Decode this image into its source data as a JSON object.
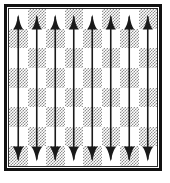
{
  "diagram": {
    "title": "Chessboard with file arrows",
    "type": "chess-board-annotation",
    "board": {
      "files": [
        "a",
        "b",
        "c",
        "d",
        "e",
        "f",
        "g",
        "h"
      ],
      "ranks": [
        "8",
        "7",
        "6",
        "5",
        "4",
        "3",
        "2",
        "1"
      ],
      "size": 8,
      "top_left_square_color": "light",
      "light_color": "#ffffff",
      "dark_color": "#8d8d8d",
      "dark_fill_style": "dither-checker",
      "border_color": "#111111",
      "squares": [
        [
          "light",
          "dark",
          "light",
          "dark",
          "light",
          "dark",
          "light",
          "dark"
        ],
        [
          "dark",
          "light",
          "dark",
          "light",
          "dark",
          "light",
          "dark",
          "light"
        ],
        [
          "light",
          "dark",
          "light",
          "dark",
          "light",
          "dark",
          "light",
          "dark"
        ],
        [
          "dark",
          "light",
          "dark",
          "light",
          "dark",
          "light",
          "dark",
          "light"
        ],
        [
          "light",
          "dark",
          "light",
          "dark",
          "light",
          "dark",
          "light",
          "dark"
        ],
        [
          "dark",
          "light",
          "dark",
          "light",
          "dark",
          "light",
          "dark",
          "light"
        ],
        [
          "light",
          "dark",
          "light",
          "dark",
          "light",
          "dark",
          "light",
          "dark"
        ],
        [
          "dark",
          "light",
          "dark",
          "light",
          "dark",
          "light",
          "dark",
          "light"
        ]
      ]
    },
    "arrows": {
      "count": 8,
      "color": "#1a1a1a",
      "direction": "double-headed-vertical",
      "head_top": "up-arrowhead",
      "head_bottom": "down-arrowhead",
      "shaft_width_px": 1.6,
      "items": [
        {
          "file": "a",
          "from": "a1",
          "to": "a8",
          "label": ""
        },
        {
          "file": "b",
          "from": "b1",
          "to": "b8",
          "label": ""
        },
        {
          "file": "c",
          "from": "c1",
          "to": "c8",
          "label": ""
        },
        {
          "file": "d",
          "from": "d1",
          "to": "d8",
          "label": ""
        },
        {
          "file": "e",
          "from": "e1",
          "to": "e8",
          "label": ""
        },
        {
          "file": "f",
          "from": "f1",
          "to": "f8",
          "label": ""
        },
        {
          "file": "g",
          "from": "g1",
          "to": "g8",
          "label": ""
        },
        {
          "file": "h",
          "from": "h1",
          "to": "h8",
          "label": ""
        }
      ]
    }
  }
}
